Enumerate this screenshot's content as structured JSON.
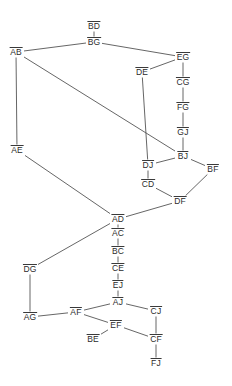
{
  "graph": {
    "title": "vertex-edge-graph",
    "style": {
      "background": "#ffffff",
      "edge_color": "#555555",
      "label_color": "#2b2b2b",
      "overline": true
    },
    "nodes": [
      {
        "id": "BD",
        "label": "BD",
        "x": 94,
        "y": 26
      },
      {
        "id": "BG",
        "label": "BG",
        "x": 94,
        "y": 42
      },
      {
        "id": "AB",
        "label": "AB",
        "x": 16,
        "y": 52
      },
      {
        "id": "EG",
        "label": "EG",
        "x": 183,
        "y": 57
      },
      {
        "id": "DE",
        "label": "DE",
        "x": 142,
        "y": 72
      },
      {
        "id": "CG",
        "label": "CG",
        "x": 183,
        "y": 82
      },
      {
        "id": "FG",
        "label": "FG",
        "x": 183,
        "y": 107
      },
      {
        "id": "GJ",
        "label": "GJ",
        "x": 183,
        "y": 132
      },
      {
        "id": "AE",
        "label": "AE",
        "x": 17,
        "y": 150
      },
      {
        "id": "BJ",
        "label": "BJ",
        "x": 183,
        "y": 156
      },
      {
        "id": "DJ",
        "label": "DJ",
        "x": 148,
        "y": 165
      },
      {
        "id": "BF",
        "label": "BF",
        "x": 213,
        "y": 169
      },
      {
        "id": "CD",
        "label": "CD",
        "x": 148,
        "y": 184
      },
      {
        "id": "DF",
        "label": "DF",
        "x": 180,
        "y": 201
      },
      {
        "id": "AD",
        "label": "AD",
        "x": 118,
        "y": 219
      },
      {
        "id": "AC",
        "label": "AC",
        "x": 118,
        "y": 233
      },
      {
        "id": "BC",
        "label": "BC",
        "x": 118,
        "y": 251
      },
      {
        "id": "CE",
        "label": "CE",
        "x": 118,
        "y": 268
      },
      {
        "id": "DG",
        "label": "DG",
        "x": 30,
        "y": 269
      },
      {
        "id": "EJ",
        "label": "EJ",
        "x": 118,
        "y": 285
      },
      {
        "id": "AJ",
        "label": "AJ",
        "x": 118,
        "y": 302
      },
      {
        "id": "AF",
        "label": "AF",
        "x": 76,
        "y": 312
      },
      {
        "id": "CJ",
        "label": "CJ",
        "x": 156,
        "y": 311
      },
      {
        "id": "AG",
        "label": "AG",
        "x": 30,
        "y": 317
      },
      {
        "id": "EF",
        "label": "EF",
        "x": 116,
        "y": 325
      },
      {
        "id": "BE",
        "label": "BE",
        "x": 93,
        "y": 339
      },
      {
        "id": "CF",
        "label": "CF",
        "x": 156,
        "y": 339
      },
      {
        "id": "FJ",
        "label": "FJ",
        "x": 156,
        "y": 363
      }
    ],
    "edges": [
      {
        "from": "BD",
        "to": "BG"
      },
      {
        "from": "BG",
        "to": "AB"
      },
      {
        "from": "BG",
        "to": "EG"
      },
      {
        "from": "AB",
        "to": "AE"
      },
      {
        "from": "AB",
        "to": "BJ"
      },
      {
        "from": "EG",
        "to": "DE"
      },
      {
        "from": "EG",
        "to": "CG"
      },
      {
        "from": "DE",
        "to": "DJ"
      },
      {
        "from": "CG",
        "to": "FG"
      },
      {
        "from": "FG",
        "to": "GJ"
      },
      {
        "from": "GJ",
        "to": "BJ"
      },
      {
        "from": "BJ",
        "to": "DJ"
      },
      {
        "from": "BJ",
        "to": "BF"
      },
      {
        "from": "DJ",
        "to": "CD"
      },
      {
        "from": "CD",
        "to": "DF"
      },
      {
        "from": "BF",
        "to": "DF"
      },
      {
        "from": "DF",
        "to": "AD"
      },
      {
        "from": "AE",
        "to": "AD"
      },
      {
        "from": "AD",
        "to": "AC"
      },
      {
        "from": "AC",
        "to": "BC"
      },
      {
        "from": "BC",
        "to": "CE"
      },
      {
        "from": "CE",
        "to": "EJ"
      },
      {
        "from": "EJ",
        "to": "AJ"
      },
      {
        "from": "AD",
        "to": "DG"
      },
      {
        "from": "DG",
        "to": "AG"
      },
      {
        "from": "AG",
        "to": "AF"
      },
      {
        "from": "AF",
        "to": "AJ"
      },
      {
        "from": "AF",
        "to": "EF"
      },
      {
        "from": "AJ",
        "to": "CJ"
      },
      {
        "from": "EF",
        "to": "BE"
      },
      {
        "from": "EF",
        "to": "CF"
      },
      {
        "from": "CJ",
        "to": "CF"
      },
      {
        "from": "CF",
        "to": "FJ"
      }
    ]
  }
}
